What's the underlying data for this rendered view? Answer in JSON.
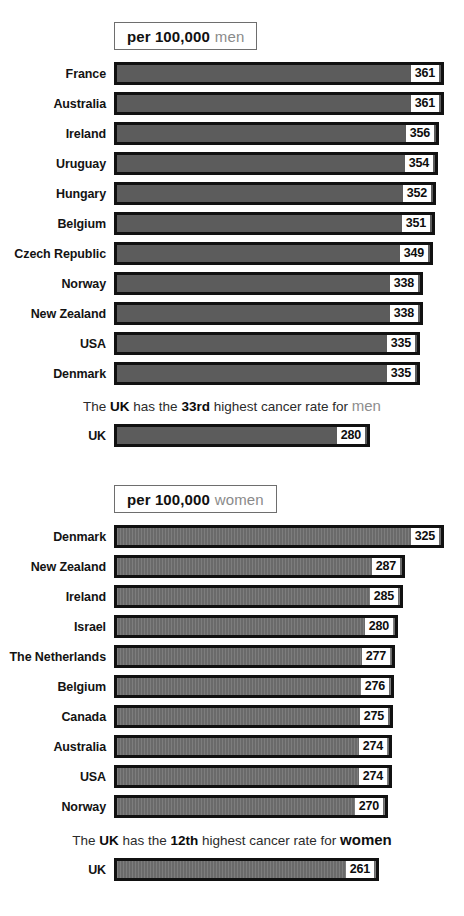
{
  "page": {
    "accent_bar_color": "#5c5c5c",
    "accent_border_color": "#111111",
    "muted_text_color": "#8a8a8a"
  },
  "chart_data": [
    {
      "type": "bar",
      "orientation": "horizontal",
      "title": "per 100,000 men",
      "title_strong": "per 100,000",
      "title_muted": "men",
      "xlabel": "",
      "ylabel": "",
      "xlim": [
        0,
        361
      ],
      "grid": false,
      "legend": "none",
      "categories": [
        "France",
        "Australia",
        "Ireland",
        "Uruguay",
        "Hungary",
        "Belgium",
        "Czech Republic",
        "Norway",
        "New Zealand",
        "USA",
        "Denmark"
      ],
      "values": [
        361,
        361,
        356,
        354,
        352,
        351,
        349,
        338,
        338,
        335,
        335
      ],
      "annotation": {
        "prefix": "The ",
        "bold1": "UK",
        "mid1": " has the ",
        "bold2": "33rd",
        "mid2": " highest cancer rate for ",
        "emphasis": "men",
        "emphasis_style": "muted"
      },
      "highlight": {
        "label": "UK",
        "value": 280
      }
    },
    {
      "type": "bar",
      "orientation": "horizontal",
      "title": "per 100,000 women",
      "title_strong": "per 100,000",
      "title_muted": "women",
      "xlabel": "",
      "ylabel": "",
      "xlim": [
        0,
        325
      ],
      "grid": false,
      "legend": "none",
      "categories": [
        "Denmark",
        "New Zealand",
        "Ireland",
        "Israel",
        "The Netherlands",
        "Belgium",
        "Canada",
        "Australia",
        "USA",
        "Norway"
      ],
      "values": [
        325,
        287,
        285,
        280,
        277,
        276,
        275,
        274,
        274,
        270
      ],
      "annotation": {
        "prefix": "The ",
        "bold1": "UK",
        "mid1": " has the ",
        "bold2": "12th",
        "mid2": " highest cancer rate for ",
        "emphasis": "women",
        "emphasis_style": "dark"
      },
      "highlight": {
        "label": "UK",
        "value": 261
      }
    }
  ]
}
